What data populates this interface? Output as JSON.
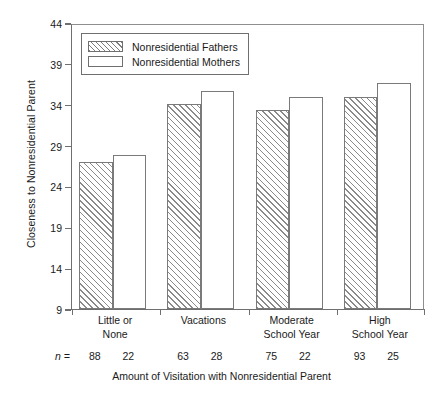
{
  "chart_data": {
    "type": "bar",
    "title": "",
    "xlabel": "Amount of Visitation with Nonresidential Parent",
    "ylabel": "Closeness to Nonresidential Parent",
    "ylim": [
      9,
      44
    ],
    "yticks": [
      9,
      14,
      19,
      24,
      29,
      34,
      39,
      44
    ],
    "grid": false,
    "legend_position": "top-left",
    "categories": [
      "Little or\nNone",
      "Vacations",
      "Moderate\nSchool Year",
      "High\nSchool Year"
    ],
    "category_lines": [
      [
        "Little or",
        "None"
      ],
      [
        "Vacations",
        ""
      ],
      [
        "Moderate",
        "School Year"
      ],
      [
        "High",
        "School Year"
      ]
    ],
    "series": [
      {
        "name": "Nonresidential Fathers",
        "fill": "hatched",
        "values": [
          27.0,
          34.1,
          33.4,
          35.0
        ],
        "n": [
          88,
          63,
          75,
          93
        ]
      },
      {
        "name": "Nonresidential Mothers",
        "fill": "white",
        "values": [
          27.9,
          35.7,
          34.9,
          36.6
        ],
        "n": [
          22,
          28,
          22,
          25
        ]
      }
    ],
    "n_label": "n =",
    "colors": {
      "axis": "#6f6f6f",
      "bar_edge": "#7a7a7a",
      "hatch": "#8a8a8a",
      "text": "#1a1a1a",
      "background": "#ffffff"
    }
  }
}
